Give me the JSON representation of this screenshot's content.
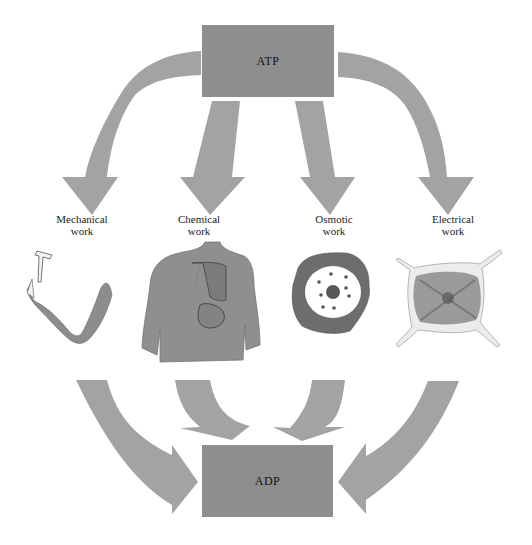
{
  "diagram": {
    "top_node": {
      "label": "ATP",
      "color": "#8e8e8e"
    },
    "bottom_node": {
      "label": "ADP",
      "color": "#8e8e8e"
    },
    "arrow_color": "#a3a3a3",
    "work_types": [
      {
        "id": "mechanical",
        "line1": "Mechanical",
        "line2": "work",
        "illustration": "arm-with-hammer"
      },
      {
        "id": "chemical",
        "line1": "Chemical",
        "line2": "work",
        "illustration": "human-torso-with-lung-and-stomach"
      },
      {
        "id": "osmotic",
        "line1": "Osmotic",
        "line2": "work",
        "illustration": "cell-with-pores"
      },
      {
        "id": "electrical",
        "line1": "Electrical",
        "line2": "work",
        "illustration": "nerve-cell-body"
      }
    ]
  }
}
